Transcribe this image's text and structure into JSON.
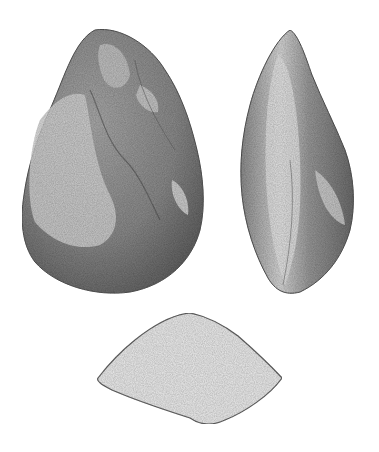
{
  "illustration": {
    "subject": "Paleolithic stone hand axe",
    "views": [
      {
        "id": "front",
        "label": "front face view"
      },
      {
        "id": "side",
        "label": "side profile view"
      },
      {
        "id": "section",
        "label": "cross-section"
      }
    ],
    "colors": {
      "background": "#ffffff",
      "stone_dark": "#5e5e5e",
      "stone_mid": "#8a8a8a",
      "stone_light": "#cfcfcf",
      "section_fill": "#e9e9e9",
      "outline": "#555555"
    }
  },
  "caption": ""
}
